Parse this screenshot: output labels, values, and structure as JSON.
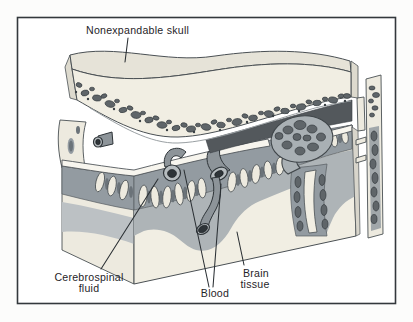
{
  "figure": {
    "labels": {
      "skull": "Nonexpandable skull",
      "csf": [
        "Cerebrospinal",
        "fluid"
      ],
      "blood": "Blood",
      "brain": [
        "Brain",
        "tissue"
      ]
    },
    "colors": {
      "frame_border": "#33383C",
      "bone_cream": "#F1EEE3",
      "bone_top_face": "#E6E3D8",
      "diploe_pebble": "#5F6569",
      "csf_space_gray": "#939BA1",
      "brain_cortex_gray": "#AEB4B7",
      "dural_sinus_dark": "#53585C",
      "vessel_lumen_dark": "#2E3438",
      "membrane_white": "#F7F5EE",
      "label_text": "#1F2428"
    }
  }
}
